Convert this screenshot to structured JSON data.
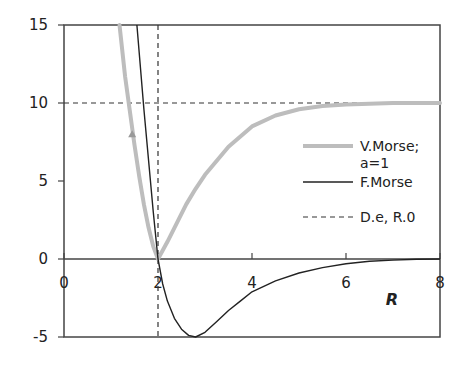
{
  "chart_data": {
    "type": "line",
    "title": "",
    "xlabel": "R",
    "ylabel": "",
    "xlim": [
      0,
      8
    ],
    "ylim": [
      -5,
      15
    ],
    "x_ticks": [
      "0",
      "2",
      "4",
      "6",
      "8"
    ],
    "y_ticks": [
      "15",
      "10",
      "5",
      "0",
      "-5"
    ],
    "grid": false,
    "legend_position": "right-inside",
    "series": [
      {
        "name": "V.Morse; a=1",
        "legend_line1": "V.Morse;",
        "legend_line2": "a=1",
        "color": "#bdbdbd",
        "style": "solid-thick",
        "x": [
          1.18,
          1.3,
          1.4,
          1.5,
          1.6,
          1.7,
          1.8,
          1.9,
          2.0,
          2.2,
          2.4,
          2.6,
          2.8,
          3.0,
          3.5,
          4.0,
          4.5,
          5.0,
          5.5,
          6.0,
          7.0,
          8.0
        ],
        "y": [
          15.0,
          11.7,
          9.5,
          7.3,
          5.3,
          3.5,
          2.0,
          0.8,
          0.0,
          1.1,
          2.3,
          3.5,
          4.5,
          5.4,
          7.2,
          8.5,
          9.2,
          9.6,
          9.8,
          9.9,
          10.0,
          10.0
        ]
      },
      {
        "name": "F.Morse",
        "color": "#222222",
        "style": "solid-thin",
        "x": [
          1.55,
          1.7,
          1.8,
          1.9,
          2.0,
          2.1,
          2.2,
          2.35,
          2.5,
          2.65,
          2.8,
          3.0,
          3.25,
          3.5,
          3.75,
          4.0,
          4.5,
          5.0,
          5.5,
          6.0,
          6.5,
          7.0,
          7.5,
          8.0
        ],
        "y": [
          15.0,
          9.6,
          6.3,
          3.0,
          0.0,
          -1.6,
          -2.7,
          -3.8,
          -4.5,
          -4.9,
          -5.0,
          -4.7,
          -4.0,
          -3.3,
          -2.7,
          -2.1,
          -1.4,
          -0.9,
          -0.55,
          -0.3,
          -0.15,
          -0.07,
          -0.02,
          0.0
        ]
      },
      {
        "name": "D.e, R.0",
        "color": "#222222",
        "style": "dashed",
        "hline_y": 10,
        "vline_x": 2
      }
    ],
    "annotations": [
      {
        "type": "marker",
        "shape": "triangle",
        "x": 1.45,
        "y": 8.0,
        "color": "#999999"
      }
    ]
  },
  "legend": {
    "vmorse_line1": "V.Morse;",
    "vmorse_line2": "a=1",
    "fmorse": "F.Morse",
    "de_r0": "D.e, R.0"
  },
  "axes": {
    "x_title": "R",
    "x_ticks": [
      "0",
      "2",
      "4",
      "6",
      "8"
    ],
    "y_ticks": [
      "15",
      "10",
      "5",
      "0",
      "-5"
    ]
  }
}
